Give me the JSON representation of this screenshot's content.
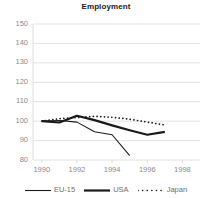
{
  "chart_data": {
    "type": "line",
    "title": "Employment",
    "xlabel": "",
    "ylabel": "",
    "xlim": [
      1989.5,
      1999.0
    ],
    "ylim": [
      80,
      150
    ],
    "grid": true,
    "legend_position": "bottom",
    "x_ticks": [
      "1990",
      "1992",
      "1994",
      "1996",
      "1998"
    ],
    "x_tick_values": [
      1990,
      1992,
      1994,
      1996,
      1998
    ],
    "y_ticks": [
      "80",
      "90",
      "100",
      "110",
      "120",
      "130",
      "140",
      "150"
    ],
    "y_tick_values": [
      80,
      90,
      100,
      110,
      120,
      130,
      140,
      150
    ],
    "series": [
      {
        "name": "EU-15",
        "style": "solid-thin",
        "color": "#1a1a1a",
        "x": [
          1990,
          1991,
          1992,
          1993,
          1994,
          1995
        ],
        "values": [
          100,
          100.3,
          99.5,
          94.5,
          93,
          82.3
        ]
      },
      {
        "name": "USA",
        "style": "solid-thick",
        "color": "#1a1a1a",
        "x": [
          1990,
          1991,
          1992,
          1993,
          1994,
          1995,
          1996,
          1997
        ],
        "values": [
          100,
          99.3,
          102.8,
          100.5,
          97.8,
          95.3,
          93,
          94.5
        ]
      },
      {
        "name": "Japan",
        "style": "dash-dot",
        "color": "#1a1a1a",
        "x": [
          1990,
          1991,
          1992,
          1993,
          1994,
          1995,
          1996,
          1997
        ],
        "values": [
          100,
          101.3,
          101.8,
          102.5,
          102,
          101,
          99.5,
          98
        ]
      }
    ]
  },
  "legend": {
    "items": [
      {
        "label": "EU-15"
      },
      {
        "label": "USA"
      },
      {
        "label": "Japan"
      }
    ]
  },
  "colors": {
    "line": "#1a1a1a",
    "grid": "#d9d9d9",
    "tick_text": "#8a8a8a",
    "legend_text": "#6f6f6f",
    "title_text": "#1a1a1a",
    "background": "#ffffff"
  }
}
